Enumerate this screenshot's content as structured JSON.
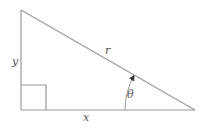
{
  "diagram": {
    "type": "right-triangle",
    "labels": {
      "y": "y",
      "x": "x",
      "r": "r",
      "theta": "θ"
    },
    "vertices": {
      "top": [
        21,
        10
      ],
      "right_angle": [
        21,
        110
      ],
      "right": [
        195,
        110
      ]
    },
    "right_angle_marker": {
      "size": 25
    },
    "angle_arc": {
      "radius": 70,
      "has_arrow": true
    },
    "colors": {
      "stroke": "#9a9a9a",
      "text": "#555555"
    }
  }
}
